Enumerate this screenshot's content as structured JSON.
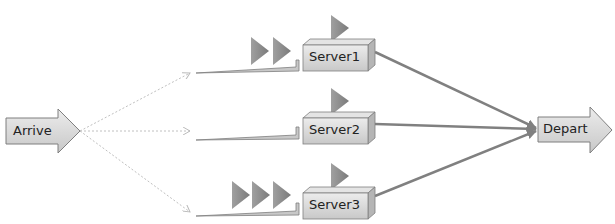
{
  "diagram": {
    "source": {
      "label": "Arrive"
    },
    "sink": {
      "label": "Depart"
    },
    "servers": [
      {
        "label": "Server1",
        "queue_length": 2
      },
      {
        "label": "Server2",
        "queue_length": 0
      },
      {
        "label": "Server3",
        "queue_length": 3
      }
    ],
    "colors": {
      "box_fill": "#d9d9d9",
      "box_stroke": "#7f7f7f",
      "entity_fill": "#8c8c8c",
      "connector": "#808080",
      "dashed": "#bfbfbf"
    }
  }
}
